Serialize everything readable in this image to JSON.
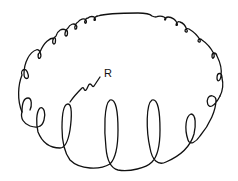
{
  "diagram": {
    "labels": [
      {
        "id": "R",
        "text": "R",
        "points_to": "front coil loop"
      }
    ],
    "colors": {
      "line": "#111111",
      "background": "#ffffff"
    }
  }
}
